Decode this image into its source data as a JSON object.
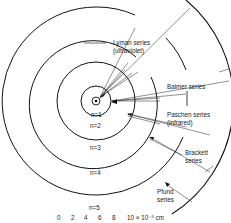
{
  "diagram": {
    "center": {
      "x": 96,
      "y": 101
    },
    "orbits": [
      {
        "label": "n=1",
        "r": 15
      },
      {
        "label": "n=2",
        "r": 39
      },
      {
        "label": "n=3",
        "r": 64
      },
      {
        "label": "n=4",
        "r": 94
      },
      {
        "label": "n=5",
        "r": 133
      }
    ],
    "series": [
      {
        "name": "Lyman series",
        "note": "(ultraviolet)"
      },
      {
        "name": "Balmer series",
        "note": ""
      },
      {
        "name": "Paschen series",
        "note": "(infrared)"
      },
      {
        "name": "Brackett",
        "note": "series"
      },
      {
        "name": "Pfund",
        "note": "series"
      }
    ],
    "scale": {
      "ticks": [
        "0",
        "2",
        "4",
        "6",
        "8"
      ],
      "unit_label": "10 × 10⁻⁸ cm"
    }
  }
}
